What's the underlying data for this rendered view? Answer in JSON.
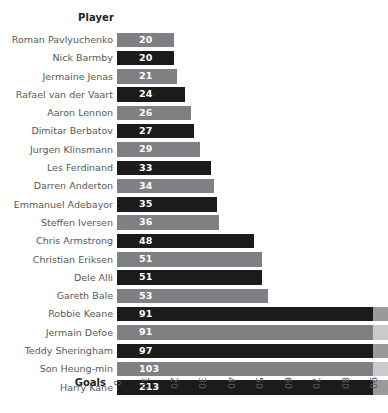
{
  "chart_data": {
    "type": "bar",
    "orientation": "horizontal",
    "title": "",
    "xlabel": "Goals",
    "ylabel": "Player",
    "categories": [
      "Roman Pavlyuchenko",
      "Nick Barmby",
      "Jermaine Jenas",
      "Rafael van der Vaart",
      "Aaron Lennon",
      "Dimitar Berbatov",
      "Jurgen Klinsmann",
      "Les Ferdinand",
      "Darren Anderton",
      "Emmanuel Adebayor",
      "Steffen Iversen",
      "Chris Armstrong",
      "Christian Eriksen",
      "Dele Alli",
      "Gareth Bale",
      "Robbie Keane",
      "Jermain Defoe",
      "Teddy Sheringham",
      "Son Heung-min",
      "Harry Kane"
    ],
    "values": [
      20,
      20,
      21,
      24,
      26,
      27,
      29,
      33,
      34,
      35,
      36,
      48,
      51,
      51,
      53,
      91,
      91,
      97,
      103,
      213
    ],
    "bar_colors": [
      "gray",
      "dark",
      "gray",
      "dark",
      "gray",
      "dark",
      "gray",
      "dark",
      "gray",
      "dark",
      "gray",
      "dark",
      "gray",
      "dark",
      "gray",
      "dark",
      "gray",
      "dark",
      "gray",
      "dark"
    ],
    "xticks": [
      0,
      10,
      20,
      30,
      40,
      50,
      60,
      70,
      80,
      90
    ],
    "xlim": [
      0,
      90
    ],
    "grid": false,
    "legend": "none",
    "data_labels": true,
    "note_clipped": "Bars for values above 90 are clipped at the axis limit and continue in a lighter tone."
  },
  "colors": {
    "bar_dark": "#1b1b1b",
    "bar_gray": "#7e8083",
    "bar_dark_clipped": "#9a9a9a",
    "bar_gray_clipped": "#c9cacb",
    "label_text": "#58595b",
    "header_text": "#231f20",
    "value_text": "#ffffff",
    "background": "#ffffff"
  }
}
